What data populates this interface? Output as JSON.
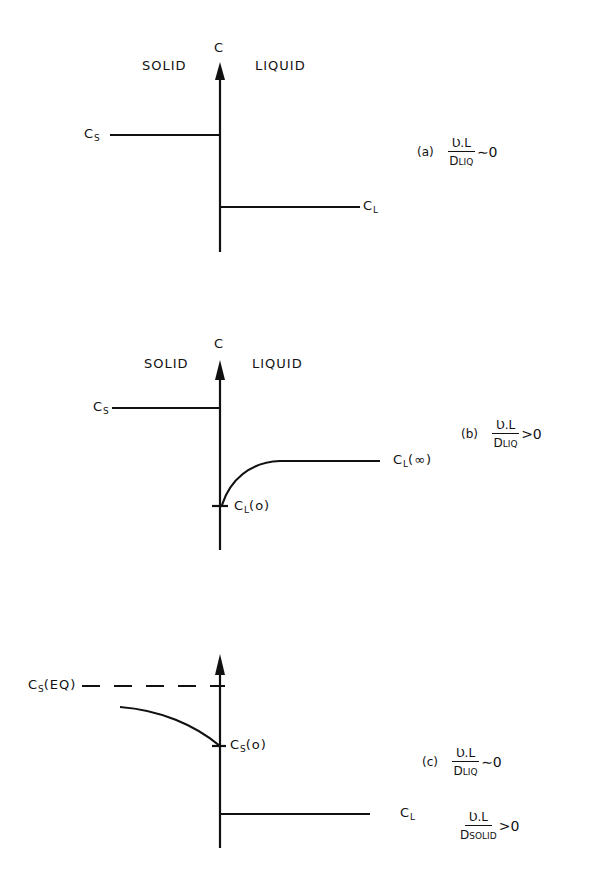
{
  "panels": [
    {
      "id": "a",
      "axis_label": "C",
      "left_label": "SOLID",
      "right_label": "LIQUID",
      "solid_label": {
        "main": "C",
        "sub": "S"
      },
      "liquid_label": {
        "main": "C",
        "sub": "L",
        "suffix": ""
      },
      "condition": {
        "tag": "(a)",
        "numerator": "Ʋ.L",
        "den_main": "D",
        "den_sub": "LIQ",
        "relation": "∼0"
      }
    },
    {
      "id": "b",
      "axis_label": "C",
      "left_label": "SOLID",
      "right_label": "LIQUID",
      "solid_label": {
        "main": "C",
        "sub": "S"
      },
      "interface_label": {
        "main": "C",
        "sub": "L",
        "suffix": "(o)"
      },
      "liquid_label": {
        "main": "C",
        "sub": "L",
        "suffix": "(∞)"
      },
      "condition": {
        "tag": "(b)",
        "numerator": "Ʋ.L",
        "den_main": "D",
        "den_sub": "LIQ",
        "relation": ">0"
      }
    },
    {
      "id": "c",
      "equilibrium_label": {
        "main": "C",
        "sub": "S",
        "suffix": "(EQ)"
      },
      "interface_label": {
        "main": "C",
        "sub": "S",
        "suffix": "(o)"
      },
      "liquid_label": {
        "main": "C",
        "sub": "L",
        "suffix": ""
      },
      "condition": {
        "tag": "(c)",
        "numerator": "Ʋ.L",
        "den_main": "D",
        "den_sub": "LIQ",
        "relation": "∼0"
      },
      "condition2": {
        "numerator": "Ʋ.L",
        "den_main": "D",
        "den_sub": "SOLID",
        "relation": ">0"
      }
    }
  ]
}
